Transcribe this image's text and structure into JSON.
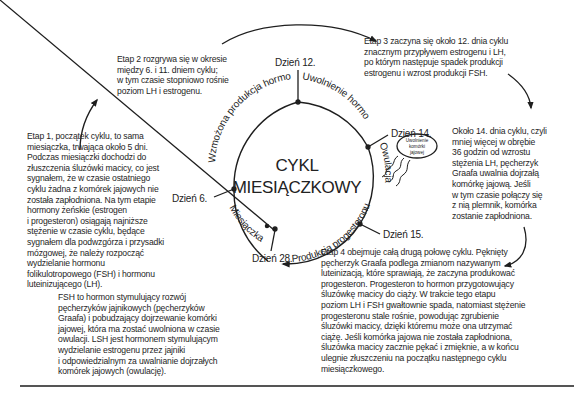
{
  "title": {
    "line1": "CYKL",
    "line2": "MIESIĄCZKOWY"
  },
  "days": {
    "day6": "Dzień 6.",
    "day12": "Dzień 12.",
    "day14": "Dzień 14.",
    "day15": "Dzień 15.",
    "day28": "Dzień 28."
  },
  "arc_labels": {
    "hormone_production": "Wzmożona produkcja hormonów",
    "hormone_release": "Uwolnienie hormonów",
    "ovulation": "Owulacja",
    "progesterone_production": "Produkcja progesteronu",
    "menstruation": "Miesiączka"
  },
  "egg_release_bubble": {
    "line1": "Uwolnienie",
    "line2": "komórki",
    "line3": "jajowej"
  },
  "stages": {
    "stage1": [
      "Etap 1, początek cyklu, to sama",
      "miesiączka, trwająca około 5 dni.",
      "Podczas miesiączki dochodzi do",
      "złuszczenia śluzówki macicy, co jest",
      "sygnałem, że w czasie ostatniego",
      "cyklu żadna z komórek jajowych nie",
      "została zapłodniona. Na tym etapie",
      "hormony żeńskie (estrogen",
      "i progesteron) osiągają najniższe",
      "stężenie w czasie cyklu, będące",
      "sygnałem dla podwzgórza i przysadki",
      "mózgowej, że należy rozpocząć",
      "wydzielanie hormonu",
      "folikulotropowego (FSH) i hormonu",
      "luteinizującego (LH)."
    ],
    "stage2": [
      "Etap 2 rozgrywa się w okresie",
      "między 6. i 11. dniem cyklu;",
      "w tym czasie stopniowo rośnie",
      "poziom LH i estrogenu."
    ],
    "stage3": [
      "Etap 3 zaczyna się około 12. dnia cyklu",
      "znacznym przypływem estrogenu i LH,",
      "po którym następuje spadek produkcji",
      "estrogenu i wzrost produkcji FSH."
    ],
    "day14_note": [
      "Około 14. dnia cyklu, czyli",
      "mniej więcej w obrębie",
      "36 godzin od wzrostu",
      "stężenia LH, pęcherzyk",
      "Graafa uwalnia dojrzałą",
      "komórkę jajową. Jeśli",
      "w tym czasie połączy się",
      "z nią plemnik, komórka",
      "zostanie zapłodniona."
    ],
    "stage4": [
      "Etap 4 obejmuje całą drugą połowę cyklu. Pęknięty",
      "pęcherzyk Graafa podlega zmianom nazywanym",
      "luteinizacją, które sprawiają, że zaczyna produkować",
      "progesteron. Progesteron to hormon przygotowujący",
      "śluzówkę macicy do ciąży. W trakcie tego etapu",
      "poziom LH i FSH gwałtownie spada, natomiast stężenie",
      "progesteronu stale rośnie, powodując zgrubienie",
      "śluzówki macicy, dzięki któremu może ona utrzymać",
      "ciążę. Jeśli komórka jajowa nie została zapłodniona,",
      "śluzówka macicy zacznie pękać i zmięknie, a w końcu",
      "ulegnie złuszczeniu na początku następnego cyklu",
      "miesiączkowego."
    ],
    "fsh_note": [
      "FSH to hormon stymulujący rozwój",
      "pęcherzyków jajnikowych (pęcherzyków",
      "Graafa) i pobudzający dojrzewanie komórki",
      "jajowej, która ma zostać uwolniona w czasie",
      "owulacji. LSH jest hormonem stymulującym",
      "wydzielanie estrogenu przez jajniki",
      "i odpowiedzialnym za uwalnianie dojrzałych",
      "komórek jajowych (owulację)."
    ]
  },
  "colors": {
    "ink": "#1e1e1e",
    "background": "#ffffff",
    "rule": "#555555"
  }
}
